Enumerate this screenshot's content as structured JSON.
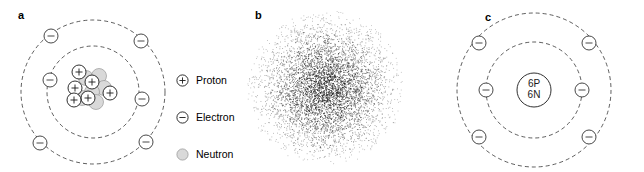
{
  "figure": {
    "panels": [
      {
        "id": "a",
        "label": "a",
        "name": "bohr-planetary-model",
        "description": "Bohr planetary model of a carbon atom with nucleus cluster of protons and neutrons and two dashed electron shells"
      },
      {
        "id": "b",
        "label": "b",
        "name": "electron-cloud-model",
        "description": "Electron cloud probability density stipple plot, dense at center fading outward"
      },
      {
        "id": "c",
        "label": "c",
        "name": "shell-model",
        "description": "Simplified shell model with labelled nucleus and two dashed electron shells"
      }
    ]
  },
  "legend": {
    "name": "particle-legend",
    "items": [
      {
        "symbol": "plus-circle-icon",
        "label": "Proton"
      },
      {
        "symbol": "minus-circle-icon",
        "label": "Electron"
      },
      {
        "symbol": "shaded-circle-icon",
        "label": "Neutron"
      }
    ]
  },
  "panel_a": {
    "label": "a",
    "shells": [
      {
        "name": "inner-shell",
        "radius": 46,
        "electron_count": 2
      },
      {
        "name": "outer-shell",
        "radius": 72,
        "electron_count": 4
      }
    ],
    "nucleus": {
      "proton_count": 6,
      "neutron_count": 6,
      "proton_symbol": "+",
      "electron_symbol": "−"
    },
    "electron_symbol": "−",
    "inner_electrons": [
      {
        "cx": 50,
        "cy": 80
      },
      {
        "cx": 142,
        "cy": 99
      }
    ],
    "outer_electrons": [
      {
        "cx": 51,
        "cy": 36
      },
      {
        "cx": 141,
        "cy": 41
      },
      {
        "cx": 40,
        "cy": 143
      },
      {
        "cx": 146,
        "cy": 142
      }
    ]
  },
  "panel_b": {
    "label": "b",
    "cloud": {
      "center_x": 110,
      "center_y": 88,
      "radius": 78,
      "dot_count": 5200,
      "dot_color": "#1a1a1a"
    }
  },
  "panel_c": {
    "label": "c",
    "nucleus_label_line1": "6P",
    "nucleus_label_line2": "6N",
    "electron_symbol": "−",
    "shells": [
      {
        "name": "inner-shell",
        "radius": 48,
        "electron_count": 2
      },
      {
        "name": "outer-shell",
        "radius": 77,
        "electron_count": 4
      }
    ],
    "inner_electrons": [
      {
        "cx": 56,
        "cy": 90
      },
      {
        "cx": 152,
        "cy": 90
      }
    ],
    "outer_electrons": [
      {
        "cx": 42,
        "cy": 42
      },
      {
        "cx": 166,
        "cy": 42
      },
      {
        "cx": 42,
        "cy": 140
      },
      {
        "cx": 166,
        "cy": 140
      }
    ]
  },
  "colors": {
    "stroke": "#1a1a1a",
    "neutron_fill": "#d9d9d9",
    "proton_fill": "#ffffff",
    "electron_fill": "#ffffff",
    "background": "#ffffff"
  }
}
